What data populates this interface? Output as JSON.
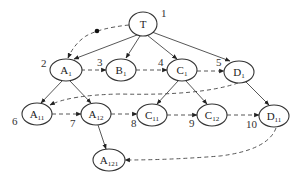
{
  "header_fragment": "",
  "diagram": {
    "type": "tree-traversal",
    "nodes": [
      {
        "id": "T",
        "base": "T",
        "sub": "",
        "order": "1",
        "cx": 143,
        "cy": 24
      },
      {
        "id": "A1",
        "base": "A",
        "sub": "1",
        "order": "2",
        "cx": 66,
        "cy": 70
      },
      {
        "id": "B1",
        "base": "B",
        "sub": "1",
        "order": "3",
        "cx": 121,
        "cy": 70
      },
      {
        "id": "C1",
        "base": "C",
        "sub": "1",
        "order": "4",
        "cx": 182,
        "cy": 70
      },
      {
        "id": "D1",
        "base": "D",
        "sub": "1",
        "order": "5",
        "cx": 239,
        "cy": 72
      },
      {
        "id": "A11",
        "base": "A",
        "sub": "11",
        "order": "6",
        "cx": 37,
        "cy": 114
      },
      {
        "id": "A12",
        "base": "A",
        "sub": "12",
        "order": "7",
        "cx": 96,
        "cy": 114
      },
      {
        "id": "C11",
        "base": "C",
        "sub": "11",
        "order": "8",
        "cx": 152,
        "cy": 115
      },
      {
        "id": "C12",
        "base": "C",
        "sub": "12",
        "order": "9",
        "cx": 212,
        "cy": 115
      },
      {
        "id": "D11",
        "base": "D",
        "sub": "11",
        "order": "10",
        "cx": 274,
        "cy": 116
      },
      {
        "id": "A121",
        "base": "A",
        "sub": "121",
        "order": "",
        "cx": 109,
        "cy": 160
      }
    ],
    "tree_edges": [
      [
        "T",
        "A1"
      ],
      [
        "T",
        "B1"
      ],
      [
        "T",
        "C1"
      ],
      [
        "T",
        "D1"
      ],
      [
        "A1",
        "A11"
      ],
      [
        "A1",
        "A12"
      ],
      [
        "C1",
        "C11"
      ],
      [
        "C1",
        "C12"
      ],
      [
        "D1",
        "D11"
      ],
      [
        "A12",
        "A121"
      ]
    ],
    "traversal_edges": [
      [
        "T",
        "A1"
      ],
      [
        "A1",
        "B1"
      ],
      [
        "B1",
        "C1"
      ],
      [
        "C1",
        "D1"
      ],
      [
        "D1",
        "A11"
      ],
      [
        "A11",
        "A12"
      ],
      [
        "A12",
        "C11"
      ],
      [
        "C11",
        "C12"
      ],
      [
        "C12",
        "D11"
      ],
      [
        "D11",
        "A121"
      ]
    ],
    "labels": {
      "T": "T",
      "order_1": "1",
      "order_2": "2",
      "order_3": "3",
      "order_4": "4",
      "order_5": "5",
      "order_6": "6",
      "order_7": "7",
      "order_8": "8",
      "order_9": "9",
      "order_10": "10"
    },
    "colors": {
      "stroke": "#333333",
      "background": "#ffffff"
    }
  }
}
